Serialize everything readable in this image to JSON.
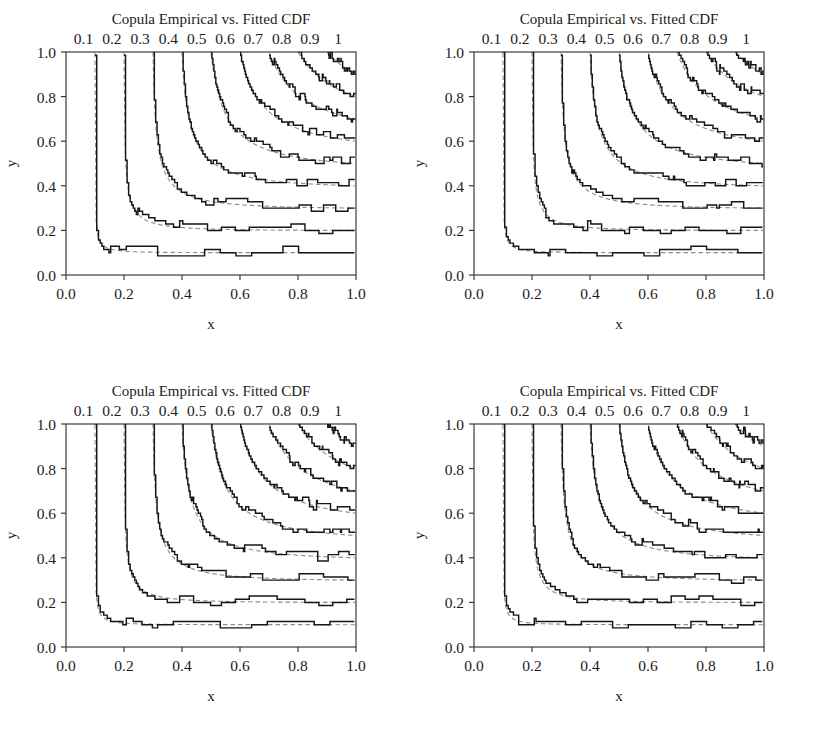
{
  "figure": {
    "width": 816,
    "height": 744,
    "background": "#ffffff",
    "panel_count": 4,
    "layout": "2x2"
  },
  "panels": [
    {
      "id": "panel-top-left",
      "title": "Copula Empirical vs. Fitted CDF",
      "xlabel": "x",
      "ylabel": "y"
    },
    {
      "id": "panel-top-right",
      "title": "Copula Empirical vs. Fitted CDF",
      "xlabel": "x",
      "ylabel": "y"
    },
    {
      "id": "panel-bottom-left",
      "title": "Copula Empirical vs. Fitted CDF",
      "xlabel": "x",
      "ylabel": "y"
    },
    {
      "id": "panel-bottom-right",
      "title": "Copula Empirical vs. Fitted CDF",
      "xlabel": "x",
      "ylabel": "y"
    }
  ],
  "chart_data": {
    "type": "line",
    "title": "Copula Empirical vs. Fitted CDF",
    "subtype": "contour-levels-of-bivariate-CDF",
    "xlabel": "x",
    "ylabel": "y",
    "xlim": [
      0.0,
      1.0
    ],
    "ylim": [
      0.0,
      1.0
    ],
    "xticks": [
      "0.0",
      "0.2",
      "0.4",
      "0.6",
      "0.8",
      "1.0"
    ],
    "xtick_values": [
      0.0,
      0.2,
      0.4,
      0.6,
      0.8,
      1.0
    ],
    "yticks": [
      "0.0",
      "0.2",
      "0.4",
      "0.6",
      "0.8",
      "1.0"
    ],
    "ytick_values": [
      0.0,
      0.2,
      0.4,
      0.6,
      0.8,
      1.0
    ],
    "grid": false,
    "legend": "none",
    "contour_levels": [
      0.1,
      0.2,
      0.3,
      0.4,
      0.5,
      0.6,
      0.7,
      0.8,
      0.9,
      1.0
    ],
    "contour_labels": [
      "0.1",
      "0.2",
      "0.3",
      "0.4",
      "0.5",
      "0.6",
      "0.7",
      "0.8",
      "0.9",
      "1"
    ],
    "contour_label_position": "top",
    "series": [
      {
        "name": "Empirical CDF",
        "style": "solid-step",
        "color": "#161616"
      },
      {
        "name": "Fitted CDF",
        "style": "dashed-smooth",
        "color": "#8e8e8e"
      }
    ],
    "panels_repeat": 4
  },
  "colors": {
    "empirical": "#161616",
    "fitted": "#8e8e8e",
    "frame": "#2b2b2b",
    "text": "#1c1c1c",
    "background": "#ffffff"
  }
}
